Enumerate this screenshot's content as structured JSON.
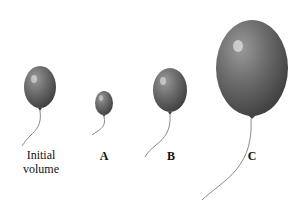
{
  "figure": {
    "colors": {
      "balloon": "#6e6e6e",
      "balloon_dark": "#3f3f3f",
      "highlight": "#d8d8d8",
      "string": "#8a8a8a",
      "background": "#ffffff"
    },
    "balloons": [
      {
        "id": "initial",
        "label_line1": "Initial",
        "label_line2": "volume"
      },
      {
        "id": "A",
        "label": "A"
      },
      {
        "id": "B",
        "label": "B"
      },
      {
        "id": "C",
        "label": "C"
      }
    ]
  }
}
